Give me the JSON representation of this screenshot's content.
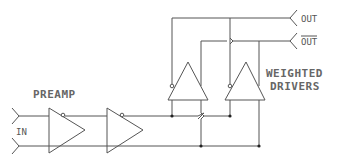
{
  "diagram": {
    "labels": {
      "preamp": "PREAMP",
      "input": "IN",
      "output": "OUT",
      "output_inverted": "OUT",
      "drivers_line1": "WEIGHTED",
      "drivers_line2": "DRIVERS"
    },
    "colors": {
      "line": "#555555",
      "junction": "#222222",
      "background": "#ffffff"
    },
    "components": [
      {
        "id": "preamp-stage-1",
        "type": "buffer-with-inverting-input"
      },
      {
        "id": "preamp-stage-2",
        "type": "buffer-with-inverting-input"
      },
      {
        "id": "driver-1",
        "type": "buffer-with-inverting-input"
      },
      {
        "id": "driver-2",
        "type": "buffer-with-inverting-input"
      }
    ]
  }
}
